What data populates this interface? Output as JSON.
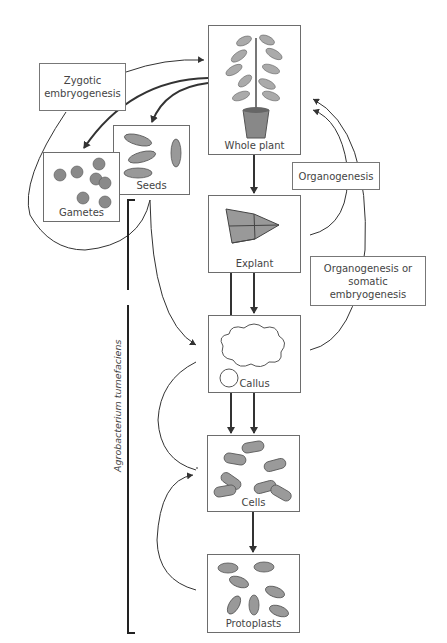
{
  "diagram": {
    "nodes": {
      "whole_plant": "Whole plant",
      "seeds": "Seeds",
      "gametes": "Gametes",
      "explant": "Explant",
      "callus": "Callus",
      "cells": "Cells",
      "protoplasts": "Protoplasts"
    },
    "process_labels": {
      "zygotic": "Zygotic embryogenesis",
      "organogenesis": "Organogenesis",
      "organogenesis_or_somatic": "Organogenesis or somatic embryogenesis"
    },
    "bracket_label": "Agrobacterium tumefaciens",
    "colors": {
      "line": "#333333",
      "box_border": "#6d6d6d",
      "fill": "#9a9a9a",
      "text": "#444444"
    }
  }
}
